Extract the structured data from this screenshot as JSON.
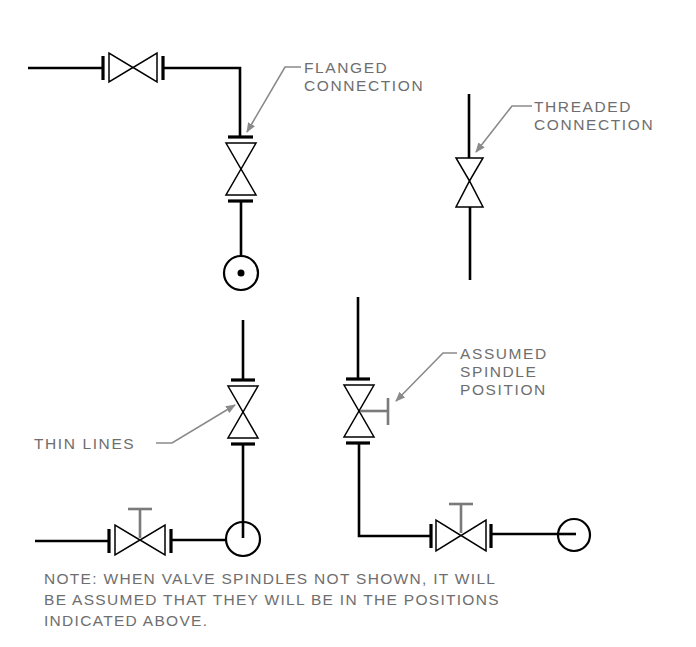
{
  "diagram": {
    "labels": {
      "flanged": [
        "FLANGED",
        "CONNECTION"
      ],
      "threaded": [
        "THREADED",
        "CONNECTION"
      ],
      "spindle": [
        "ASSUMED",
        "SPINDLE",
        "POSITION"
      ],
      "thin_lines": "THIN LINES"
    },
    "note": [
      "NOTE: WHEN VALVE SPINDLES NOT SHOWN, IT WILL",
      "BE ASSUMED THAT THEY WILL BE IN THE POSITIONS",
      "INDICATED ABOVE."
    ],
    "colors": {
      "line": "#000000",
      "annotation": "#6e6e6e"
    },
    "symbols": [
      {
        "name": "flanged-gate-valve-horizontal",
        "connection": "flanged"
      },
      {
        "name": "flanged-gate-valve-vertical",
        "connection": "flanged"
      },
      {
        "name": "threaded-gate-valve-vertical",
        "connection": "threaded"
      },
      {
        "name": "pipe-turning-toward-viewer",
        "icon": "circle-dot"
      },
      {
        "name": "flanged-gate-valve-vertical-thin-lines",
        "connection": "flanged"
      },
      {
        "name": "flanged-valve-with-side-spindle",
        "connection": "flanged"
      },
      {
        "name": "flanged-valve-with-top-spindle-left",
        "connection": "flanged"
      },
      {
        "name": "flanged-valve-with-top-spindle-right",
        "connection": "flanged"
      },
      {
        "name": "pipe-turning-away-from-viewer",
        "icon": "circle"
      }
    ]
  }
}
